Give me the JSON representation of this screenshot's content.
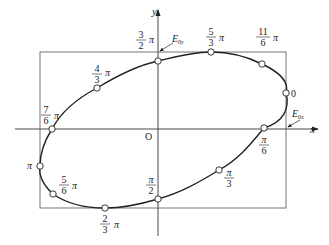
{
  "diagram": {
    "type": "polarization-ellipse",
    "colors": {
      "stroke": "#2a2a2a",
      "frame": "#555555",
      "point_fill": "#ffffff"
    },
    "axes": {
      "x_label": "x",
      "y_label": "y",
      "origin_label": "O"
    },
    "annotations": {
      "e0y": {
        "main": "E",
        "sub": "0y"
      },
      "e0x": {
        "main": "E",
        "sub": "0x"
      }
    },
    "points": [
      {
        "id": "p0",
        "num": "",
        "den": "",
        "suffix": "0"
      },
      {
        "id": "p1",
        "num": "π",
        "den": "6",
        "suffix": ""
      },
      {
        "id": "p2",
        "num": "π",
        "den": "3",
        "suffix": ""
      },
      {
        "id": "p3",
        "num": "π",
        "den": "2",
        "suffix": ""
      },
      {
        "id": "p4",
        "num": "2",
        "den": "3",
        "suffix": "π"
      },
      {
        "id": "p5",
        "num": "5",
        "den": "6",
        "suffix": "π"
      },
      {
        "id": "p6",
        "num": "",
        "den": "",
        "suffix": "π"
      },
      {
        "id": "p7",
        "num": "7",
        "den": "6",
        "suffix": "π"
      },
      {
        "id": "p8",
        "num": "4",
        "den": "3",
        "suffix": "π"
      },
      {
        "id": "p9",
        "num": "3",
        "den": "2",
        "suffix": "π"
      },
      {
        "id": "p10",
        "num": "5",
        "den": "3",
        "suffix": "π"
      },
      {
        "id": "p11",
        "num": "11",
        "den": "6",
        "suffix": "π"
      }
    ]
  }
}
